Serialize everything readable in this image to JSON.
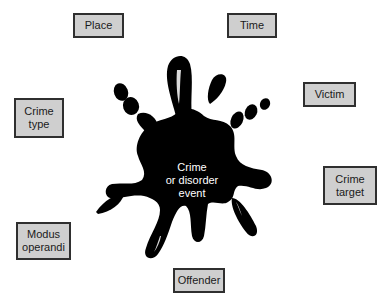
{
  "diagram": {
    "type": "hub-and-spoke",
    "center": {
      "lines": [
        "Crime",
        "or disorder",
        "event"
      ],
      "shape": "ink-splat",
      "color": "#000000",
      "text_color": "#ffffff"
    },
    "nodes": [
      {
        "id": "place",
        "lines": [
          "Place"
        ]
      },
      {
        "id": "time",
        "lines": [
          "Time"
        ]
      },
      {
        "id": "crime-type",
        "lines": [
          "Crime",
          "type"
        ]
      },
      {
        "id": "victim",
        "lines": [
          "Victim"
        ]
      },
      {
        "id": "crime-target",
        "lines": [
          "Crime",
          "target"
        ]
      },
      {
        "id": "modus-operandi",
        "lines": [
          "Modus",
          "operandi"
        ]
      },
      {
        "id": "offender",
        "lines": [
          "Offender"
        ]
      }
    ],
    "colors": {
      "box_fill": "#cfcfcf",
      "box_border": "#2f2f2f",
      "background": "#ffffff"
    }
  }
}
